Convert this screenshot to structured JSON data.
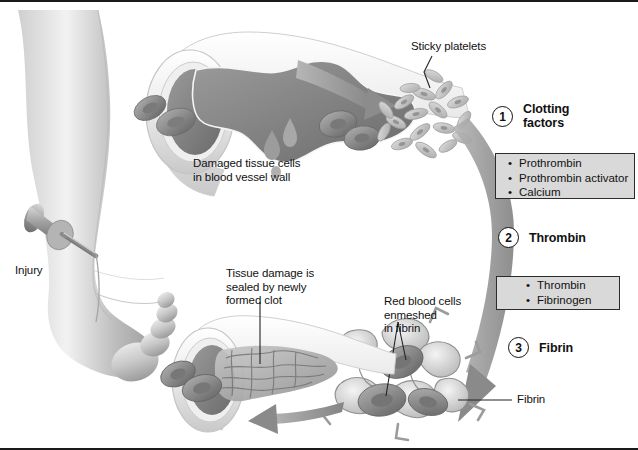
{
  "figure": {
    "background": "#ffffff",
    "frame_color": "#1a1a1a",
    "arrow_color": "#8e8e8e",
    "box_fill": "#d9d9d9",
    "box_border": "#2b2b2b",
    "text_color": "#111111"
  },
  "labels": {
    "injury": "Injury",
    "damaged_tissue": "Damaged tissue cells\nin blood vessel wall",
    "sticky_platelets": "Sticky platelets",
    "tissue_sealed": "Tissue damage is\nsealed by newly\nformed clot",
    "red_blood_cells": "Red blood cells\nenmeshed\nin fibrin",
    "fibrin": "Fibrin"
  },
  "steps": [
    {
      "number": "1",
      "name": "Clotting\nfactors"
    },
    {
      "number": "2",
      "name": "Thrombin"
    },
    {
      "number": "3",
      "name": "Fibrin"
    }
  ],
  "boxes": [
    {
      "id": "clotting-factors-box",
      "items": [
        "Prothrombin",
        "Prothrombin activator",
        "Calcium"
      ]
    },
    {
      "id": "thrombin-box",
      "items": [
        "Thrombin",
        "Fibrinogen"
      ]
    }
  ]
}
